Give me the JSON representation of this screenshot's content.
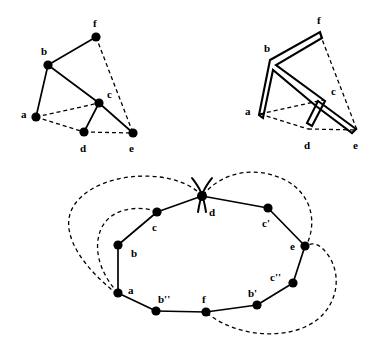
{
  "figure": {
    "background_color": "#ffffff",
    "ink_color": "#000000",
    "width": 379,
    "height": 351
  },
  "panels": [
    {
      "id": "panel-tree",
      "name": "tree-with-chords",
      "caption": "",
      "nodes": [
        {
          "id": "f",
          "label": "f",
          "x": 96,
          "y": 37,
          "lx": 93,
          "ly": 27
        },
        {
          "id": "b",
          "label": "b",
          "x": 48,
          "y": 65,
          "lx": 43,
          "ly": 55
        },
        {
          "id": "c",
          "label": "c",
          "x": 99,
          "y": 103,
          "lx": 107,
          "ly": 98
        },
        {
          "id": "a",
          "label": "a",
          "x": 36,
          "y": 117,
          "lx": 22,
          "ly": 115
        },
        {
          "id": "d",
          "label": "d",
          "x": 84,
          "y": 132,
          "lx": 80,
          "ly": 149
        },
        {
          "id": "e",
          "label": "e",
          "x": 133,
          "y": 133,
          "lx": 129,
          "ly": 149
        }
      ],
      "solid_edges": [
        [
          "a",
          "b"
        ],
        [
          "b",
          "f"
        ],
        [
          "b",
          "c"
        ],
        [
          "c",
          "d"
        ],
        [
          "c",
          "e"
        ]
      ],
      "dashed_edges": [
        [
          "f",
          "e"
        ],
        [
          "a",
          "c"
        ],
        [
          "a",
          "d"
        ],
        [
          "d",
          "e"
        ]
      ]
    },
    {
      "id": "panel-doubled",
      "name": "doubled-tree-tour",
      "caption": "",
      "nodes": [
        {
          "id": "f",
          "label": "f",
          "x": 320,
          "y": 34,
          "lx": 317,
          "ly": 24
        },
        {
          "id": "b",
          "label": "b",
          "x": 272,
          "y": 62,
          "lx": 266,
          "ly": 52
        },
        {
          "id": "c",
          "label": "c",
          "x": 323,
          "y": 100,
          "lx": 331,
          "ly": 95
        },
        {
          "id": "a",
          "label": "a",
          "x": 260,
          "y": 114,
          "lx": 246,
          "ly": 112
        },
        {
          "id": "d",
          "label": "d",
          "x": 308,
          "y": 129,
          "lx": 304,
          "ly": 146
        },
        {
          "id": "e",
          "label": "e",
          "x": 357,
          "y": 130,
          "lx": 353,
          "ly": 146
        }
      ],
      "solid_edges": [
        [
          "a",
          "b"
        ],
        [
          "b",
          "f"
        ],
        [
          "b",
          "c"
        ],
        [
          "c",
          "d"
        ],
        [
          "c",
          "e"
        ]
      ],
      "dashed_edges": [
        [
          "f",
          "e"
        ],
        [
          "a",
          "c"
        ],
        [
          "a",
          "d"
        ],
        [
          "d",
          "e"
        ]
      ],
      "tour_order": [
        "a",
        "b",
        "f",
        "b",
        "c",
        "d",
        "c",
        "e",
        "c",
        "b",
        "a"
      ]
    },
    {
      "id": "panel-cycle",
      "name": "resulting-cycle",
      "caption": "",
      "nodes": [
        {
          "id": "d",
          "label": "d",
          "x": 202,
          "y": 196,
          "lx": 209,
          "ly": 212
        },
        {
          "id": "c",
          "label": "c",
          "x": 157,
          "y": 212,
          "lx": 152,
          "ly": 228
        },
        {
          "id": "cp",
          "label": "c'",
          "x": 268,
          "y": 208,
          "lx": 263,
          "ly": 224
        },
        {
          "id": "b",
          "label": "b",
          "x": 118,
          "y": 245,
          "lx": 131,
          "ly": 253
        },
        {
          "id": "e",
          "label": "e",
          "x": 305,
          "y": 246,
          "lx": 293,
          "ly": 246
        },
        {
          "id": "cpp",
          "label": "c''",
          "x": 293,
          "y": 283,
          "lx": 277,
          "ly": 278
        },
        {
          "id": "a",
          "label": "a",
          "x": 118,
          "y": 293,
          "lx": 128,
          "ly": 292
        },
        {
          "id": "bp",
          "label": "b'",
          "x": 257,
          "y": 305,
          "lx": 250,
          "ly": 294
        },
        {
          "id": "bpp",
          "label": "b''",
          "x": 156,
          "y": 311,
          "lx": 160,
          "ly": 300
        },
        {
          "id": "f",
          "label": "f",
          "x": 206,
          "y": 312,
          "lx": 200,
          "ly": 300
        }
      ],
      "cycle_order": [
        "a",
        "b",
        "c",
        "d",
        "cp",
        "e",
        "cpp",
        "bp",
        "f",
        "bpp",
        "a"
      ],
      "crossing_marker": {
        "at": "d",
        "name": "crossing-x-marker"
      },
      "dashed_chords": [
        {
          "from": "a",
          "to": "d",
          "name": "chord-a-d-outer-left"
        },
        {
          "from": "a",
          "to": "c",
          "name": "chord-a-c-outer"
        },
        {
          "from": "f",
          "to": "e",
          "name": "chord-f-e-outer-right"
        },
        {
          "from": "d",
          "to": "e",
          "name": "chord-d-e-outer-right"
        }
      ]
    }
  ]
}
